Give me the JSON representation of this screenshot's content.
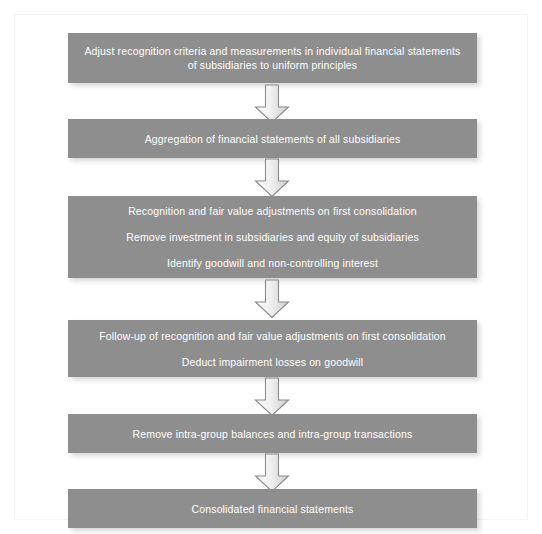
{
  "diagram": {
    "colors": {
      "node_fill": "#8e8e8e",
      "node_text": "#ffffff",
      "arrow_fill": "#e0e0e0",
      "arrow_stroke": "#8a8a8a",
      "background": "#ffffff"
    },
    "nodes": [
      {
        "id": "node-1",
        "lines": [
          "Adjust recognition criteria and measurements in individual financial statements\nof subsidiaries to uniform principles"
        ]
      },
      {
        "id": "node-2",
        "lines": [
          "Aggregation of financial statements of all subsidiaries"
        ]
      },
      {
        "id": "node-3",
        "lines": [
          "Recognition and fair value adjustments on first consolidation",
          "Remove investment in subsidiaries and equity of subsidiaries",
          "Identify goodwill and non-controlling interest"
        ]
      },
      {
        "id": "node-4",
        "lines": [
          "Follow-up of recognition and fair value adjustments on first consolidation",
          "Deduct impairment losses on goodwill"
        ]
      },
      {
        "id": "node-5",
        "lines": [
          "Remove intra-group balances and intra-group transactions"
        ]
      },
      {
        "id": "node-6",
        "lines": [
          "Consolidated financial statements"
        ]
      }
    ],
    "arrows": [
      {
        "id": "arrow-1",
        "icon": "down-block-arrow-icon",
        "from": "node-1",
        "to": "node-2"
      },
      {
        "id": "arrow-2",
        "icon": "down-block-arrow-icon",
        "from": "node-2",
        "to": "node-3"
      },
      {
        "id": "arrow-3",
        "icon": "down-block-arrow-icon",
        "from": "node-3",
        "to": "node-4"
      },
      {
        "id": "arrow-4",
        "icon": "down-block-arrow-icon",
        "from": "node-4",
        "to": "node-5"
      },
      {
        "id": "arrow-5",
        "icon": "down-block-arrow-icon",
        "from": "node-5",
        "to": "node-6"
      }
    ]
  }
}
